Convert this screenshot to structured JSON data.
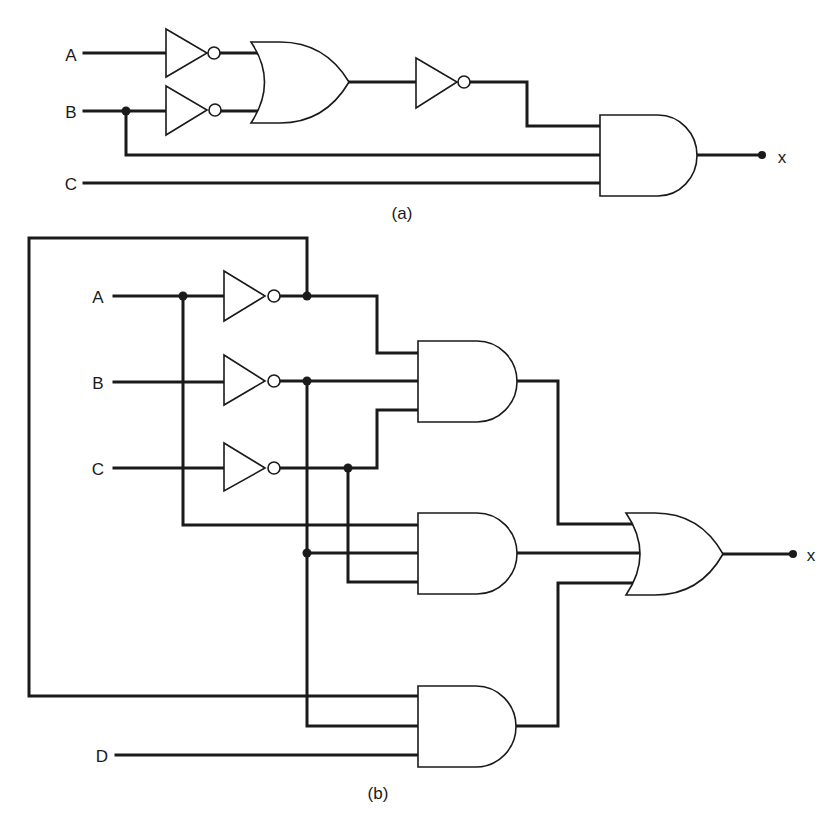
{
  "figure": {
    "circuit_a": {
      "caption": "(a)",
      "inputs": [
        {
          "label": "A"
        },
        {
          "label": "B"
        },
        {
          "label": "C"
        }
      ],
      "output_label": "x",
      "gates": [
        "NOT(A)",
        "NOT(B)",
        "OR(A', B')",
        "NOT(OR)",
        "AND(NOT(OR), B, C)"
      ]
    },
    "circuit_b": {
      "caption": "(b)",
      "inputs": [
        {
          "label": "A"
        },
        {
          "label": "B"
        },
        {
          "label": "C"
        },
        {
          "label": "D"
        }
      ],
      "output_label": "x",
      "gates": [
        "NOT(A)",
        "NOT(B)",
        "NOT(C)",
        "AND(A', B', C')",
        "AND(A, B', C')",
        "AND(A', B', D)",
        "OR(AND1, AND2, AND3)"
      ]
    }
  },
  "colors": {
    "ink": "#1a1a1a",
    "background": "#ffffff"
  }
}
